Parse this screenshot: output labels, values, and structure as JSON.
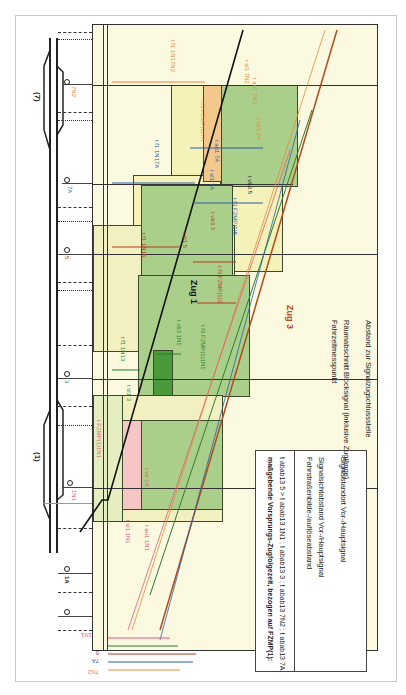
{
  "diagram": {
    "orientation": "rotated-90-clockwise",
    "stations": {
      "left": "(1)",
      "right": "(7)"
    },
    "signals": [
      {
        "id": "1N1",
        "color": "#e05a7a"
      },
      {
        "id": "1A",
        "color": "#222222"
      },
      {
        "id": "3",
        "color": "#2e7d32"
      },
      {
        "id": "5",
        "color": "#b23a1a"
      },
      {
        "id": "7A",
        "color": "#2a5ea8"
      },
      {
        "id": "7N2",
        "color": "#e88a3a"
      }
    ],
    "trains": [
      {
        "name": "Zug 1",
        "color": "#111111"
      },
      {
        "name": "Zug 3",
        "color": "#b34a1a"
      }
    ],
    "time_labels": [
      "t f1 1N17N2",
      "t f1 1N17A",
      "t f1 1N15",
      "t f1 1N13",
      "t f3 FZMP(1)7A",
      "t f3 FZMP(1)5",
      "t f3 FZMP(1)3",
      "t f3 FZMP(1)1N1",
      "t FZMP(1)1N1",
      "t sl1 7N2",
      "t au1 7N2",
      "t sl1 7A",
      "t au1 7A",
      "t vb3 7A",
      "t vb3 5",
      "t vb3 3",
      "t vb3 1N1",
      "t sl1 5",
      "t sl1 3",
      "t sl1 1N1",
      "t au1 1N1",
      "t vb 1A"
    ],
    "bottom_row_labels": [
      "1N1",
      "3",
      "5",
      "7A",
      "7N2"
    ]
  },
  "legend": {
    "heading": "maßgebende Vorsprungs-Zugfolgezeit, bezogen auf FZMP(1):",
    "formula": "t abab13 5  > t abab13 1N1 ; t abab13 3 ; t abab13 7N2 ; t abab13 7A",
    "items": [
      {
        "style": "dash-dot",
        "label": "Fahrstraßenbilde-/auflöseabstand"
      },
      {
        "style": "dotted",
        "label": "Signalsichtabstand Vor-/Hauptsignal"
      },
      {
        "style": "solid",
        "label": "Signalstandort Vor-/Hauptsignal"
      },
      {
        "style": "solid-thin",
        "label": "Fahrzeitmesspunkt"
      },
      {
        "style": "dashed",
        "label": "Räumabschnitt Blocksignal (inklusive Zuglänge)"
      },
      {
        "style": "dash-dot-dot",
        "label": "Abstand zur Signalzugschlussstelle"
      }
    ]
  },
  "colors": {
    "background": "#fbf9e0",
    "green_block": "#a9cf8a",
    "dark_green": "#4a9a3a",
    "pink": "#f6c6c6",
    "orange": "#f2c98a",
    "light_blue": "#b8d4e8",
    "yellow_block": "#f4f2b8"
  }
}
